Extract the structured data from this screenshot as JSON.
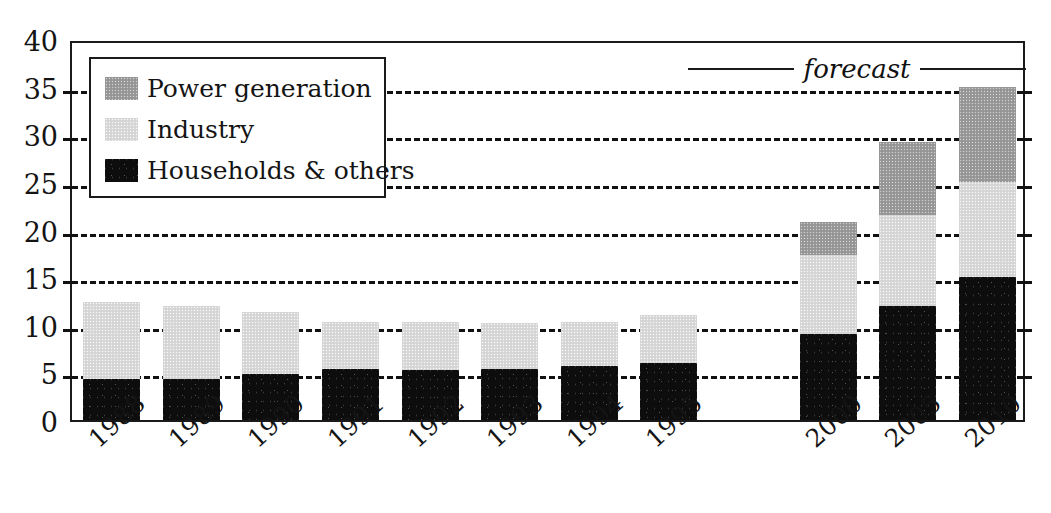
{
  "chart_data": {
    "type": "bar",
    "stacked": true,
    "title": "",
    "xlabel": "",
    "ylabel": "",
    "ylim": [
      0,
      40
    ],
    "ytick_step": 5,
    "yticks": [
      "0",
      "5",
      "10",
      "15",
      "20",
      "25",
      "30",
      "35",
      "40"
    ],
    "grid": "horizontal-dashed",
    "legend_position": "upper-left-inside",
    "categories": [
      "1988",
      "1989",
      "1990",
      "1991",
      "1992",
      "1993",
      "1994",
      "1995",
      "",
      "2000",
      "2005",
      "2010"
    ],
    "series": [
      {
        "name": "Households & others",
        "color": "#0d0d0d",
        "values": [
          4.3,
          4.3,
          4.8,
          5.4,
          5.3,
          5.4,
          5.7,
          6.0,
          null,
          9.0,
          12.0,
          15.0
        ]
      },
      {
        "name": "Industry",
        "color": "#d9d9d9",
        "values": [
          8.1,
          7.7,
          6.5,
          4.9,
          5.0,
          4.8,
          4.6,
          5.0,
          null,
          8.3,
          9.5,
          10.0
        ]
      },
      {
        "name": "Power generation",
        "color": "#9b9b9b",
        "values": [
          0,
          0,
          0,
          0,
          0,
          0,
          0,
          0,
          null,
          3.5,
          7.7,
          10.0
        ]
      }
    ],
    "totals": [
      12.4,
      12.0,
      11.3,
      10.3,
      10.3,
      10.2,
      10.3,
      11.0,
      null,
      20.8,
      29.2,
      35.0
    ],
    "annotations": [
      {
        "name": "forecast",
        "text": "forecast",
        "style": "italic",
        "covers": [
          "2000",
          "2005",
          "2010"
        ]
      }
    ]
  },
  "legend": {
    "items": [
      {
        "label": "Power generation",
        "color": "#9b9b9b"
      },
      {
        "label": "Industry",
        "color": "#d9d9d9"
      },
      {
        "label": "Households & others",
        "color": "#0d0d0d"
      }
    ]
  },
  "forecast": {
    "label": "forecast"
  },
  "axis": {
    "y_labels": [
      "40",
      "35",
      "30",
      "25",
      "20",
      "15",
      "10",
      "5",
      "0"
    ],
    "x_labels": [
      "1988",
      "1989",
      "1990",
      "1991",
      "1992",
      "1993",
      "1994",
      "1995",
      "2000",
      "2005",
      "2010"
    ]
  }
}
